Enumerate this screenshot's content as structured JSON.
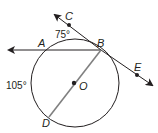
{
  "diagram": {
    "type": "circle-geometry",
    "circle": {
      "center": "O",
      "cx": 75,
      "cy": 83,
      "r": 44
    },
    "points": {
      "A": {
        "label": "A",
        "x": 32,
        "y": 50
      },
      "B": {
        "label": "B",
        "x": 101,
        "y": 50
      },
      "C": {
        "label": "C",
        "x": 69,
        "y": 25
      },
      "D": {
        "label": "D",
        "x": 49,
        "y": 117
      },
      "E": {
        "label": "E",
        "x": 137,
        "y": 75
      },
      "O": {
        "label": "O",
        "x": 74,
        "y": 83
      }
    },
    "segments": [
      {
        "name": "secant-AB",
        "from": "B",
        "direction": "left-ray"
      },
      {
        "name": "tangent-CE",
        "through": [
          "C",
          "B",
          "E"
        ],
        "style": "line-with-arrows"
      },
      {
        "name": "diameter-BD",
        "from": "B",
        "to": "D",
        "via": "O",
        "color": "#7a7a7a"
      }
    ],
    "arc_labels": {
      "arc_AB": "75°",
      "arc_AD": "105°"
    },
    "colors": {
      "stroke": "#231f20",
      "diameter": "#808080"
    }
  }
}
